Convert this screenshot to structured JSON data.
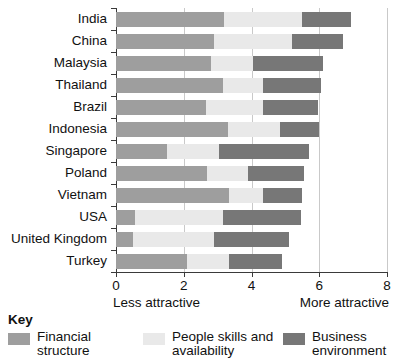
{
  "chart_data": {
    "type": "bar",
    "orientation": "horizontal",
    "stacked": true,
    "title": "",
    "subtitle": "",
    "xlabel": "",
    "ylabel": "",
    "xlim": [
      0,
      8
    ],
    "xticks": [
      0,
      2,
      4,
      6,
      8
    ],
    "xtick_labels": [
      "0",
      "2",
      "4",
      "6",
      "8"
    ],
    "axis_end_labels": {
      "left": "Less attractive",
      "right": "More attractive"
    },
    "grid": true,
    "grid_axis": "x",
    "legend_position": "bottom-left",
    "legend_title": "Key",
    "categories": [
      "India",
      "China",
      "Malaysia",
      "Thailand",
      "Brazil",
      "Indonesia",
      "Singapore",
      "Poland",
      "Vietnam",
      "USA",
      "United Kingdom",
      "Turkey"
    ],
    "series": [
      {
        "name": "Financial structure",
        "color": "#9e9e9e",
        "values": [
          3.2,
          2.9,
          2.8,
          3.15,
          2.65,
          3.3,
          1.5,
          2.7,
          3.35,
          0.55,
          0.5,
          2.1
        ]
      },
      {
        "name": "People skills and availability",
        "color": "#e9e9e9",
        "values": [
          2.3,
          2.3,
          1.25,
          1.2,
          1.7,
          1.55,
          1.55,
          1.2,
          1.0,
          2.6,
          2.4,
          1.25
        ]
      },
      {
        "name": "Business environment",
        "color": "#777777",
        "values": [
          1.45,
          1.5,
          2.05,
          1.7,
          1.6,
          1.15,
          2.65,
          1.65,
          1.15,
          2.3,
          2.2,
          1.55
        ]
      }
    ],
    "totals": [
      6.95,
      6.7,
      6.1,
      6.05,
      5.95,
      6.0,
      5.7,
      5.55,
      5.5,
      5.45,
      5.1,
      4.9
    ]
  }
}
